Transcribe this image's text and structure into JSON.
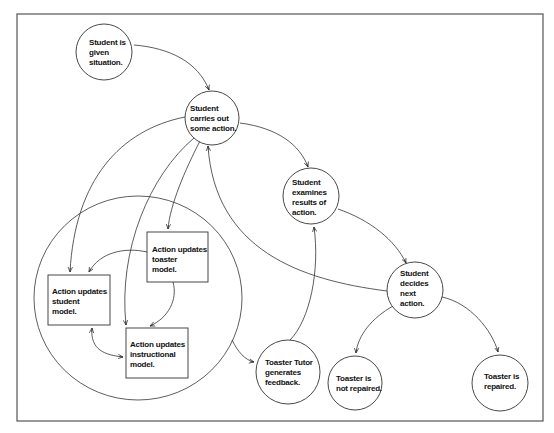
{
  "diagram": {
    "frame": {
      "x": 17,
      "y": 14,
      "w": 526,
      "h": 407
    },
    "colors": {
      "stroke": "#333333",
      "frame": "#555555",
      "background": "#ffffff",
      "text": "#111111"
    },
    "container": {
      "cx": 138,
      "cy": 298,
      "rx": 104,
      "ry": 102
    },
    "nodes": [
      {
        "id": "given",
        "shape": "circle",
        "cx": 104,
        "cy": 52,
        "r": 28,
        "lines": [
          "Student is",
          "given",
          "situation."
        ],
        "tx": 89,
        "ty": 38
      },
      {
        "id": "action",
        "shape": "circle",
        "cx": 212,
        "cy": 118,
        "r": 27,
        "lines": [
          "Student",
          "carries out",
          "some action."
        ],
        "tx": 190,
        "ty": 104
      },
      {
        "id": "examines",
        "shape": "circle",
        "cx": 311,
        "cy": 196,
        "r": 28,
        "lines": [
          "Student",
          "examines",
          "results of",
          "action."
        ],
        "tx": 292,
        "ty": 178
      },
      {
        "id": "decides",
        "shape": "circle",
        "cx": 415,
        "cy": 290,
        "r": 28,
        "lines": [
          "Student",
          "decides",
          "next",
          "action."
        ],
        "tx": 400,
        "ty": 269
      },
      {
        "id": "toaster-model",
        "shape": "box",
        "x": 147,
        "y": 232,
        "w": 61,
        "h": 50,
        "lines": [
          "Action updates",
          "toaster",
          "model."
        ],
        "tx": 152,
        "ty": 245
      },
      {
        "id": "student-model",
        "shape": "box",
        "x": 48,
        "y": 275,
        "w": 62,
        "h": 50,
        "lines": [
          "Action updates",
          "student",
          "model."
        ],
        "tx": 52,
        "ty": 287
      },
      {
        "id": "instructional-model",
        "shape": "box",
        "x": 126,
        "y": 328,
        "w": 62,
        "h": 50,
        "lines": [
          "Action updates",
          "instructional",
          "model."
        ],
        "tx": 130,
        "ty": 340
      },
      {
        "id": "feedback",
        "shape": "circle",
        "cx": 288,
        "cy": 372,
        "r": 32,
        "lines": [
          "Toaster Tutor",
          "generates",
          "feedback."
        ],
        "tx": 265,
        "ty": 358
      },
      {
        "id": "not-repaired",
        "shape": "circle",
        "cx": 355,
        "cy": 383,
        "r": 27,
        "lines": [
          "Toaster is",
          "not repaired."
        ],
        "tx": 336,
        "ty": 374
      },
      {
        "id": "repaired",
        "shape": "circle",
        "cx": 500,
        "cy": 383,
        "r": 28,
        "lines": [
          "Toaster is",
          "repaired."
        ],
        "tx": 484,
        "ty": 372
      }
    ],
    "edges": [
      {
        "from": "given",
        "to": "action",
        "d": "M134,45 C170,48 198,62 209,90"
      },
      {
        "from": "action",
        "to": "examines",
        "d": "M240,123 C278,128 300,145 308,167"
      },
      {
        "from": "examines",
        "to": "decides",
        "d": "M338,209 C370,220 395,240 406,263"
      },
      {
        "from": "decides",
        "to": "action",
        "d": "M387,291 C300,280 215,250 208,146"
      },
      {
        "from": "action",
        "to": "student-model",
        "d": "M185,117 C120,130 75,180 70,272"
      },
      {
        "from": "action",
        "to": "instructional-model",
        "d": "M194,138 C150,175 118,250 126,325"
      },
      {
        "from": "action",
        "to": "toaster-model",
        "d": "M200,141 C185,170 170,205 168,229"
      },
      {
        "from": "toaster-model",
        "to": "student-model",
        "d": "M147,252 C125,247 100,252 89,272"
      },
      {
        "from": "toaster-model",
        "to": "instructional-model",
        "d": "M173,282 C178,300 168,318 150,326"
      },
      {
        "from": "student-model",
        "to": "instructional-model",
        "d": "M92,328 C90,350 105,355 123,357",
        "bidirectional": true
      },
      {
        "from": "container",
        "to": "feedback",
        "d": "M232,340 C238,352 245,360 254,362"
      },
      {
        "from": "feedback",
        "to": "examines",
        "d": "M290,340 C310,320 320,270 314,227"
      },
      {
        "from": "decides",
        "to": "not-repaired",
        "d": "M393,306 C372,318 358,335 356,353"
      },
      {
        "from": "decides",
        "to": "repaired",
        "d": "M442,297 C470,303 492,330 498,352"
      }
    ]
  }
}
